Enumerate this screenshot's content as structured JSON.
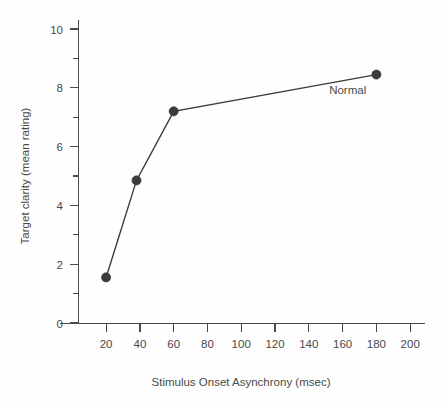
{
  "chart_data": {
    "type": "line",
    "title": "",
    "subtitle": "",
    "xlabel": "Stimulus Onset Asynchrony (msec)",
    "ylabel": "Target clarity (mean rating)",
    "xlim": [
      0,
      210
    ],
    "ylim": [
      0,
      10
    ],
    "grid": false,
    "legend_position": "inline-annotation",
    "x_ticks": [
      20,
      40,
      60,
      80,
      100,
      120,
      140,
      160,
      180,
      200
    ],
    "x_tick_labels": [
      "20",
      "40",
      "60",
      "80",
      "100",
      "120",
      "140",
      "160",
      "180",
      "200"
    ],
    "y_ticks": [
      0,
      2,
      4,
      6,
      8,
      10
    ],
    "y_tick_labels": [
      "0",
      "2",
      "4",
      "6",
      "8",
      "10"
    ],
    "y_minor_ticks": [
      1,
      3,
      5,
      7,
      9
    ],
    "series": [
      {
        "name": "Normal",
        "marker": "filled-circle",
        "color": "#3b3b3b",
        "x": [
          20,
          38,
          60,
          180
        ],
        "values": [
          1.55,
          4.85,
          7.2,
          8.45
        ]
      }
    ],
    "annotations": [
      {
        "text": "Normal",
        "x": 163,
        "y": 7.8
      }
    ]
  },
  "colors": {
    "ink": "#3b3b3b",
    "axis": "#4a4a4a",
    "background": "#fefefe"
  }
}
